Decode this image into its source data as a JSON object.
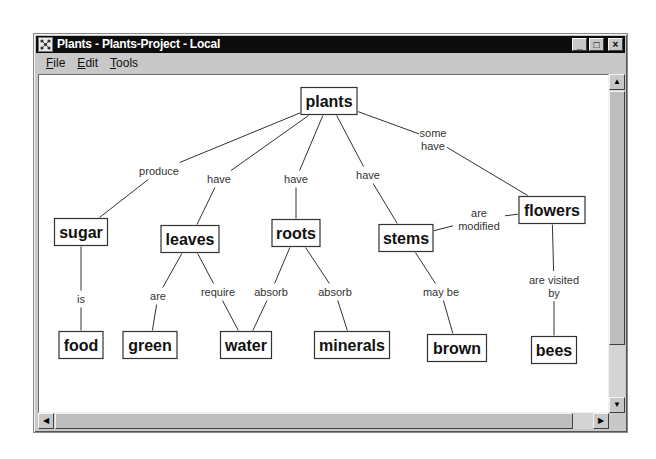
{
  "window": {
    "title": "Plants - Plants-Project - Local",
    "controls": {
      "minimize": "_",
      "maximize": "□",
      "close": "×"
    }
  },
  "menu": [
    {
      "label": "File",
      "mnemonic": "F",
      "rest": "ile"
    },
    {
      "label": "Edit",
      "mnemonic": "E",
      "rest": "dit"
    },
    {
      "label": "Tools",
      "mnemonic": "T",
      "rest": "ools"
    }
  ],
  "scrollbars": {
    "up": "▲",
    "down": "▼",
    "left": "◀",
    "right": "▶"
  },
  "concept_map": {
    "nodes": [
      {
        "id": "plants",
        "label": "plants",
        "x": 328,
        "y": 100,
        "w": 56
      },
      {
        "id": "sugar",
        "label": "sugar",
        "x": 80,
        "y": 231,
        "w": 53
      },
      {
        "id": "leaves",
        "label": "leaves",
        "x": 189,
        "y": 238,
        "w": 58
      },
      {
        "id": "roots",
        "label": "roots",
        "x": 295,
        "y": 232,
        "w": 48
      },
      {
        "id": "stems",
        "label": "stems",
        "x": 405,
        "y": 237,
        "w": 54
      },
      {
        "id": "flowers",
        "label": "flowers",
        "x": 551,
        "y": 209,
        "w": 66
      },
      {
        "id": "food",
        "label": "food",
        "x": 80,
        "y": 344,
        "w": 44
      },
      {
        "id": "green",
        "label": "green",
        "x": 149,
        "y": 344,
        "w": 54
      },
      {
        "id": "water",
        "label": "water",
        "x": 245,
        "y": 344,
        "w": 51
      },
      {
        "id": "minerals",
        "label": "minerals",
        "x": 351,
        "y": 344,
        "w": 75
      },
      {
        "id": "brown",
        "label": "brown",
        "x": 456,
        "y": 347,
        "w": 59
      },
      {
        "id": "bees",
        "label": "bees",
        "x": 553,
        "y": 349,
        "w": 45
      }
    ],
    "links": [
      {
        "from": "plants",
        "to": "sugar",
        "label": [
          "produce"
        ],
        "lx": 158,
        "ly": 170
      },
      {
        "from": "plants",
        "to": "leaves",
        "label": [
          "have"
        ],
        "lx": 218,
        "ly": 178
      },
      {
        "from": "plants",
        "to": "roots",
        "label": [
          "have"
        ],
        "lx": 295,
        "ly": 178
      },
      {
        "from": "plants",
        "to": "stems",
        "label": [
          "have"
        ],
        "lx": 367,
        "ly": 174
      },
      {
        "from": "plants",
        "to": "flowers",
        "label": [
          "some",
          "have"
        ],
        "lx": 432,
        "ly": 138
      },
      {
        "from": "sugar",
        "to": "food",
        "label": [
          "is"
        ],
        "lx": 80,
        "ly": 298
      },
      {
        "from": "leaves",
        "to": "green",
        "label": [
          "are"
        ],
        "lx": 157,
        "ly": 295
      },
      {
        "from": "leaves",
        "to": "water",
        "label": [
          "require"
        ],
        "lx": 217,
        "ly": 291
      },
      {
        "from": "roots",
        "to": "water",
        "label": [
          "absorb"
        ],
        "lx": 270,
        "ly": 291
      },
      {
        "from": "roots",
        "to": "minerals",
        "label": [
          "absorb"
        ],
        "lx": 334,
        "ly": 291
      },
      {
        "from": "stems",
        "to": "brown",
        "label": [
          "may be"
        ],
        "lx": 440,
        "ly": 291
      },
      {
        "from": "flowers",
        "to": "stems",
        "label": [
          "are",
          "modified"
        ],
        "lx": 478,
        "ly": 218
      },
      {
        "from": "flowers",
        "to": "bees",
        "label": [
          "are visited",
          "by"
        ],
        "lx": 553,
        "ly": 285
      }
    ]
  }
}
